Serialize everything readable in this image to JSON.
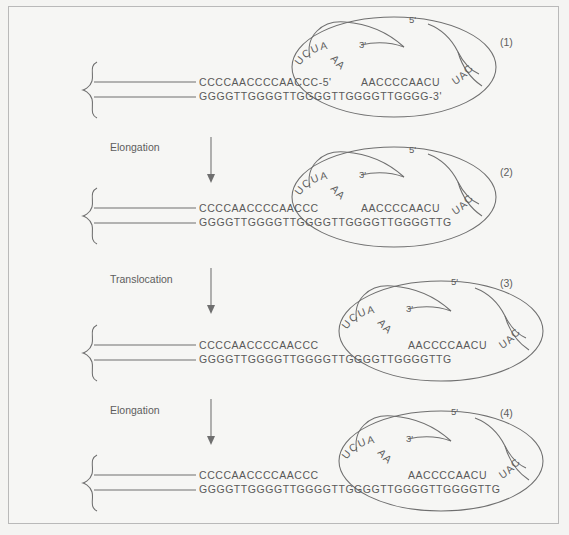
{
  "figure": {
    "background_color": "#f4f4f2",
    "border_color": "#b9b9b9",
    "ink_color": "#5d5d5d"
  },
  "steps": [
    {
      "id": "step-elongation-1",
      "label": "Elongation"
    },
    {
      "id": "step-translocation",
      "label": "Translocation"
    },
    {
      "id": "step-elongation-2",
      "label": "Elongation"
    }
  ],
  "panels": [
    {
      "number": "(1)",
      "dna_top": "CCCCAACCCCAACCC",
      "dna_top_end": "-5'",
      "dna_bottom": "GGGGTTGGGGTTGGGGTTGGGGTTGGGG",
      "dna_bottom_end": "-3'",
      "rna_arc_left": "UCUA",
      "rna_arc_mid": "AA",
      "rna_template": "AACCCCAACU",
      "rna_arc_right": "UAC",
      "rna_three_prime": "3'",
      "rna_five_prime": "5'"
    },
    {
      "number": "(2)",
      "dna_top": "CCCCAACCCCAACCC",
      "dna_top_end": "",
      "dna_bottom": "GGGGTTGGGGTTGGGGTTGGGGTTGGGGTTG",
      "dna_bottom_end": "",
      "rna_arc_left": "UCUA",
      "rna_arc_mid": "AA",
      "rna_template": "AACCCCAACU",
      "rna_arc_right": "UAC",
      "rna_three_prime": "3'",
      "rna_five_prime": "5'"
    },
    {
      "number": "(3)",
      "dna_top": "CCCCAACCCCAACCC",
      "dna_top_end": "",
      "dna_bottom": "GGGGTTGGGGTTGGGGTTGGGGTTGGGGTTG",
      "dna_bottom_end": "",
      "rna_arc_left": "UCUA",
      "rna_arc_mid": "AA",
      "rna_template": "AACCCCAACU",
      "rna_arc_right": "UAC",
      "rna_three_prime": "3'",
      "rna_five_prime": "5'"
    },
    {
      "number": "(4)",
      "dna_top": "CCCCAACCCCAACCC",
      "dna_top_end": "",
      "dna_bottom": "GGGGTTGGGGTTGGGGTTGGGGTTGGGGTTGGGGTTG",
      "dna_bottom_end": "",
      "rna_arc_left": "UCUA",
      "rna_arc_mid": "AA",
      "rna_template": "AACCCCAACU",
      "rna_arc_right": "UAC",
      "rna_three_prime": "3'",
      "rna_five_prime": "5'"
    }
  ],
  "icons": {
    "chromosome_end": "squiggle-bracket-icon",
    "telomerase": "ellipse-enzyme-icon",
    "arrow": "down-arrow-icon"
  }
}
